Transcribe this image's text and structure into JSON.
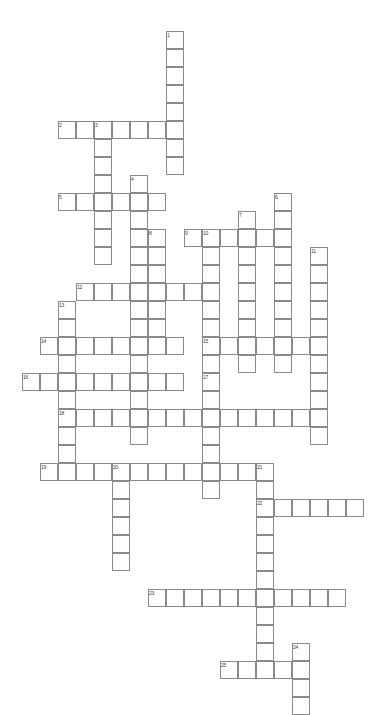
{
  "puzzle": {
    "title": "Crossword Puzzle Grid",
    "cell_size": 18,
    "origin_x": 22,
    "origin_y": 31,
    "grid_cols": 20,
    "grid_rows": 38,
    "colors": {
      "cell_border": "#8a8a8a",
      "cell_fill": "#ffffff",
      "number_text": "#3a3a3a",
      "page_background": "#ffffff"
    },
    "entries": [
      {
        "number": "1",
        "direction": "down",
        "col": 8,
        "row": 0,
        "length": 8
      },
      {
        "number": "2",
        "direction": "across",
        "col": 2,
        "row": 5,
        "length": 7
      },
      {
        "number": "3",
        "direction": "down",
        "col": 4,
        "row": 5,
        "length": 8
      },
      {
        "number": "4",
        "direction": "down",
        "col": 6,
        "row": 8,
        "length": 15
      },
      {
        "number": "5",
        "direction": "across",
        "col": 2,
        "row": 9,
        "length": 6
      },
      {
        "number": "6",
        "direction": "down",
        "col": 14,
        "row": 9,
        "length": 10
      },
      {
        "number": "7",
        "direction": "down",
        "col": 12,
        "row": 10,
        "length": 9
      },
      {
        "number": "8",
        "direction": "down",
        "col": 7,
        "row": 11,
        "length": 6
      },
      {
        "number": "9",
        "direction": "across",
        "col": 9,
        "row": 11,
        "length": 6
      },
      {
        "number": "10",
        "direction": "down",
        "col": 10,
        "row": 11,
        "length": 13
      },
      {
        "number": "11",
        "direction": "down",
        "col": 16,
        "row": 12,
        "length": 11
      },
      {
        "number": "12",
        "direction": "across",
        "col": 3,
        "row": 14,
        "length": 8
      },
      {
        "number": "13",
        "direction": "down",
        "col": 2,
        "row": 15,
        "length": 9
      },
      {
        "number": "14",
        "direction": "across",
        "col": 1,
        "row": 17,
        "length": 8
      },
      {
        "number": "15",
        "direction": "across",
        "col": 10,
        "row": 17,
        "length": 6
      },
      {
        "number": "16",
        "direction": "across",
        "col": 0,
        "row": 19,
        "length": 9
      },
      {
        "number": "17",
        "direction": "down",
        "col": 10,
        "row": 19,
        "length": 7
      },
      {
        "number": "18",
        "direction": "across",
        "col": 2,
        "row": 21,
        "length": 15
      },
      {
        "number": "19",
        "direction": "across",
        "col": 1,
        "row": 24,
        "length": 12
      },
      {
        "number": "20",
        "direction": "down",
        "col": 5,
        "row": 24,
        "length": 6
      },
      {
        "number": "21",
        "direction": "down",
        "col": 13,
        "row": 24,
        "length": 12
      },
      {
        "number": "22",
        "direction": "across",
        "col": 13,
        "row": 26,
        "length": 6
      },
      {
        "number": "23",
        "direction": "across",
        "col": 7,
        "row": 31,
        "length": 11
      },
      {
        "number": "24",
        "direction": "down",
        "col": 15,
        "row": 34,
        "length": 5
      },
      {
        "number": "25",
        "direction": "across",
        "col": 11,
        "row": 35,
        "length": 5
      }
    ]
  }
}
